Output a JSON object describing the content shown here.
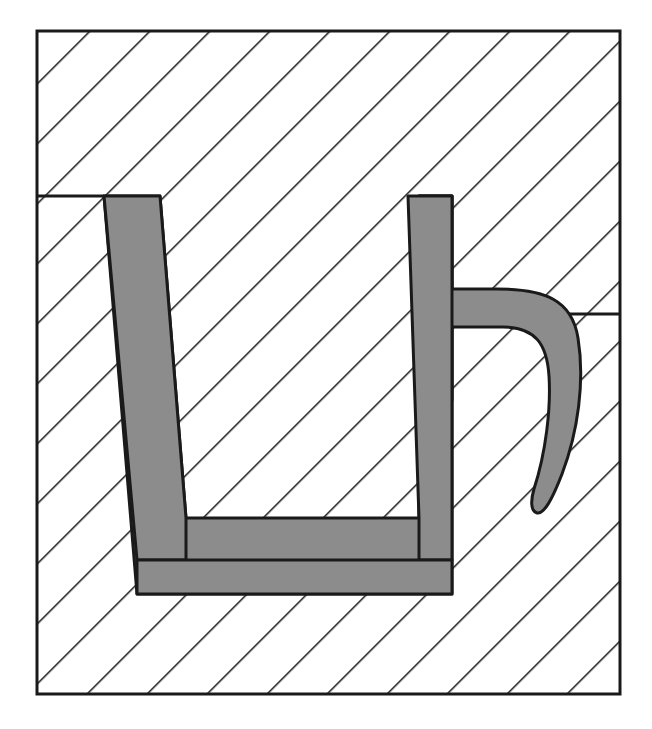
{
  "figure": {
    "title": "Hatched cross-section with grey U-shaped insert",
    "caption": "",
    "canvas": {
      "width": 652,
      "height": 729,
      "background": "#ffffff"
    },
    "colors": {
      "outline": "#1a1a1a",
      "hatch_line": "#1a1a1a",
      "part_fill": "#8c8c8c",
      "section_fill": "#ffffff",
      "page_background": "#ffffff"
    },
    "frame": {
      "label": "section-boundary",
      "x": 37,
      "y": 31,
      "width": 583,
      "height": 663,
      "stroke_width": 3
    },
    "hatching": {
      "style": "section-hatch-45",
      "angle_deg": 45,
      "direction": "down-right",
      "spacing_px": 30,
      "line_width": 3
    },
    "step_lines": [
      {
        "label": "left-step-line",
        "x1": 37,
        "y1": 196,
        "x2": 104,
        "y2": 196
      },
      {
        "label": "right-step-line",
        "x1": 568,
        "y1": 314,
        "x2": 620,
        "y2": 314
      }
    ],
    "part": {
      "label": "grey-insert-u-with-hook",
      "fill": "#8c8c8c",
      "stroke": "#1a1a1a",
      "stroke_width": 3,
      "outline_path": "M 104 196 L 160 196 L 186 518 L 419 518 L 419 196 L 452 196 L 452 289 L 497 289 Q 560 289 572 325 Q 582 360 576 420 Q 570 470 556 500 Q 546 514 538 512 Q 532 508 534 494 Q 544 456 547 410 Q 549 365 541 344 Q 532 326 505 326 L 452 326 L 452 594 L 137 594 L 137 540 Z",
      "anchor_points": [
        {
          "name": "left-stem-top-left",
          "x": 104,
          "y": 196
        },
        {
          "name": "left-stem-top-right",
          "x": 160,
          "y": 196
        },
        {
          "name": "left-stem-inner-bottom",
          "x": 186,
          "y": 518
        },
        {
          "name": "right-stem-inner-bottom",
          "x": 419,
          "y": 518
        },
        {
          "name": "right-stem-top-left",
          "x": 408,
          "y": 196
        },
        {
          "name": "right-stem-top-right",
          "x": 452,
          "y": 196
        },
        {
          "name": "hook-shoulder",
          "x": 497,
          "y": 289
        },
        {
          "name": "hook-outer-crest",
          "x": 576,
          "y": 400
        },
        {
          "name": "hook-tip",
          "x": 538,
          "y": 512
        },
        {
          "name": "hook-inner-return",
          "x": 452,
          "y": 326
        },
        {
          "name": "bottom-bar-right",
          "x": 452,
          "y": 594
        },
        {
          "name": "bottom-bar-left",
          "x": 137,
          "y": 594
        }
      ]
    }
  }
}
